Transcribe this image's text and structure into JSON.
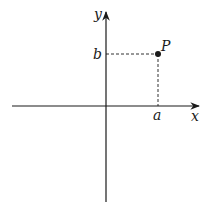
{
  "diagram": {
    "type": "cartesian-point",
    "axes": {
      "x_label": "x",
      "y_label": "y"
    },
    "point": {
      "label": "P",
      "x_coord_label": "a",
      "y_coord_label": "b"
    },
    "colors": {
      "stroke": "#1a1a1a",
      "background": "#ffffff"
    }
  }
}
